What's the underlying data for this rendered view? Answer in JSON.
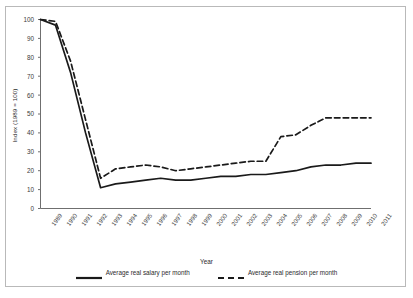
{
  "chart_data": {
    "type": "line",
    "title": "",
    "xlabel": "Year",
    "ylabel": "Index (1989 = 100)",
    "xlim": [
      1989,
      2011
    ],
    "ylim": [
      0,
      100
    ],
    "grid": false,
    "legend_position": "bottom",
    "categories": [
      "1989",
      "1990",
      "1991",
      "1992",
      "1993",
      "1994",
      "1995",
      "1996",
      "1997",
      "1998",
      "1999",
      "2000",
      "2001",
      "2002",
      "2003",
      "2004",
      "2005",
      "2006",
      "2007",
      "2008",
      "2009",
      "2010",
      "2011"
    ],
    "yticks": [
      0,
      10,
      20,
      30,
      40,
      50,
      60,
      70,
      80,
      90,
      100
    ],
    "series": [
      {
        "name": "Average real salary per month",
        "style": "solid",
        "color": "#1a1a1a",
        "values": [
          100,
          97,
          72,
          40,
          11,
          13,
          14,
          15,
          16,
          15,
          15,
          16,
          17,
          17,
          18,
          18,
          19,
          20,
          22,
          23,
          23,
          24,
          24
        ]
      },
      {
        "name": "Average real pension per month",
        "style": "dashed",
        "color": "#1a1a1a",
        "values": [
          100,
          99,
          78,
          47,
          16,
          21,
          22,
          23,
          22,
          20,
          21,
          22,
          23,
          24,
          25,
          25,
          38,
          39,
          44,
          48,
          48,
          48,
          48
        ]
      }
    ]
  },
  "axis": {
    "y_label": "Index (1989 = 100)",
    "x_label": "Year"
  },
  "legend": {
    "items": [
      {
        "label": "Average real salary per month",
        "style": "solid"
      },
      {
        "label": "Average real pension per month",
        "style": "dashed"
      }
    ]
  }
}
